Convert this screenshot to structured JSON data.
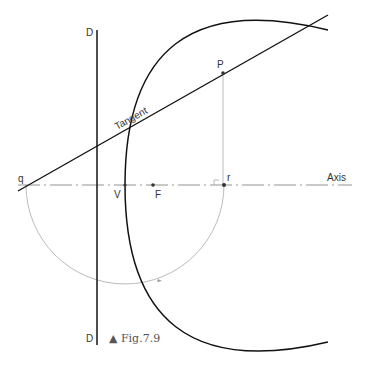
{
  "figure": {
    "caption": "▲ Fig.7.9",
    "labels": {
      "directrix_top": "D",
      "directrix_bottom": "D",
      "tangent": "Tangent",
      "point_p": "P",
      "point_q": "q",
      "point_r": "r",
      "vertex": "V",
      "focus": "F",
      "axis": "Axis"
    },
    "colors": {
      "curve": "#111111",
      "construction": "#999999",
      "axis": "#666666"
    }
  }
}
